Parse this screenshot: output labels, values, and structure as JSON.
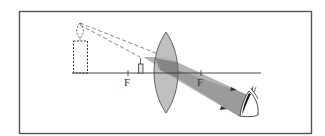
{
  "diagram": {
    "labels": {
      "focal_left": "F",
      "focal_right": "F"
    },
    "elements": {
      "object": "candle (real object inside focal length)",
      "image": "virtual enlarged upright candle image",
      "lens": "converging lens",
      "observer": "eye"
    },
    "colors": {
      "frame": "#555555",
      "axis": "#333333",
      "lens_fill": "#b5b5b5",
      "beam_fill": "#9a9a9a",
      "beam_overlap": "#707070",
      "dashed_rays": "#666666"
    }
  }
}
